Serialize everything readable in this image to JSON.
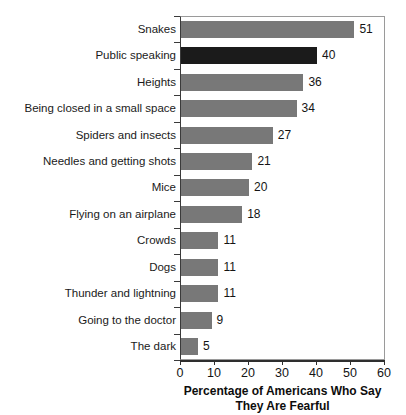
{
  "chart_data": {
    "type": "bar",
    "orientation": "horizontal",
    "title": "",
    "xlabel": "Percentage of Americans Who Say They Are Fearful",
    "xlabel_lines": [
      "Percentage of Americans Who Say",
      "They Are Fearful"
    ],
    "ylabel": "",
    "categories": [
      "Snakes",
      "Public speaking",
      "Heights",
      "Being closed in a small space",
      "Spiders and insects",
      "Needles and getting shots",
      "Mice",
      "Flying on an airplane",
      "Crowds",
      "Dogs",
      "Thunder and lightning",
      "Going to the doctor",
      "The dark"
    ],
    "values": [
      51,
      40,
      36,
      34,
      27,
      21,
      20,
      18,
      11,
      11,
      11,
      9,
      5
    ],
    "value_labels": [
      "51",
      "40",
      "36",
      "34",
      "27",
      "21",
      "20",
      "18",
      "11",
      "11",
      "11",
      "9",
      "5"
    ],
    "highlighted_index": 1,
    "xlim": [
      0,
      60
    ],
    "xticks": [
      0,
      10,
      20,
      30,
      40,
      50,
      60
    ],
    "xtick_labels": [
      "0",
      "10",
      "20",
      "30",
      "40",
      "50",
      "60"
    ],
    "grid": false,
    "legend": null,
    "colors": {
      "bar": "#787878",
      "bar_highlight": "#1b1b1b",
      "text": "#141414",
      "axis": "#2e2e2e",
      "background": "#ffffff"
    }
  }
}
